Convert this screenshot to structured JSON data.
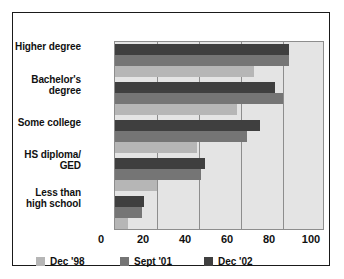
{
  "chart_data": {
    "type": "bar",
    "orientation": "horizontal",
    "title": "",
    "xlabel": "",
    "ylabel": "",
    "xlim": [
      0,
      100
    ],
    "xticks": [
      0,
      20,
      40,
      60,
      80,
      100
    ],
    "grid": true,
    "legend_position": "bottom-left",
    "categories": [
      "Higher degree",
      "Bachelor's degree",
      "Some college",
      "HS diploma/ GED",
      "Less than high school"
    ],
    "category_lines": [
      [
        "Higher degree"
      ],
      [
        "Bachelor's",
        "degree"
      ],
      [
        "Some college"
      ],
      [
        "HS diploma/",
        "GED"
      ],
      [
        "Less than",
        "high school"
      ]
    ],
    "series": [
      {
        "name": "Dec '98",
        "color": "#b6b6b6",
        "values": [
          66,
          58,
          39,
          20,
          6
        ]
      },
      {
        "name": "Sept '01",
        "color": "#757575",
        "values": [
          83,
          80,
          63,
          41,
          13
        ]
      },
      {
        "name": "Dec '02",
        "color": "#3f3f3f",
        "values": [
          83,
          76,
          69,
          43,
          14
        ]
      }
    ]
  },
  "legend": {
    "items": [
      {
        "label": "Dec '98",
        "color": "#b6b6b6"
      },
      {
        "label": "Sept '01",
        "color": "#757575"
      },
      {
        "label": "Dec '02",
        "color": "#3f3f3f"
      }
    ]
  },
  "axis": {
    "x_tick_labels": [
      "0",
      "20",
      "40",
      "60",
      "80",
      "100"
    ]
  },
  "colors": {
    "plot_background": "#e4e4e4",
    "grid": "#8d8d8d",
    "frame": "#1a1a1a",
    "text": "#111111",
    "page_background": "#ffffff"
  }
}
